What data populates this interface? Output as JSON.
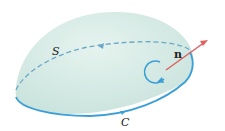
{
  "figure": {
    "surface_label": "S",
    "curve_label": "C",
    "normal_label": "n"
  },
  "colors": {
    "surface_fill": "#d7ece6",
    "curve": "#3a9fd6",
    "normal": "#e06060"
  }
}
